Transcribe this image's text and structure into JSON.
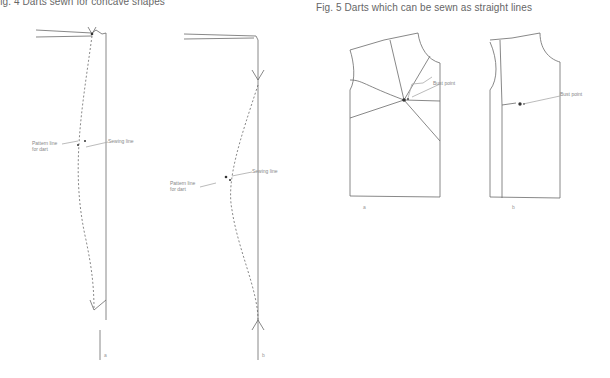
{
  "figures": [
    {
      "id": "fig4",
      "caption": "Fig. 4   Darts sewn for concave shapes",
      "panels": [
        {
          "sublabel": "a",
          "labels": {
            "pattern_line": "Pattern line\nfor dart",
            "sewing_line": "Sewing line"
          }
        },
        {
          "sublabel": "b",
          "labels": {
            "pattern_line": "Pattern line\nfor dart",
            "sewing_line": "Sewing line"
          }
        }
      ]
    },
    {
      "id": "fig5",
      "caption": "Fig. 5   Darts which can be sewn as straight lines",
      "panels": [
        {
          "sublabel": "a",
          "labels": {
            "bust_point": "Bust point"
          }
        },
        {
          "sublabel": "b",
          "labels": {
            "bust_point": "Bust point"
          }
        }
      ]
    }
  ],
  "colors": {
    "line": "#6a6a6a",
    "text": "#777777",
    "background": "#ffffff"
  }
}
